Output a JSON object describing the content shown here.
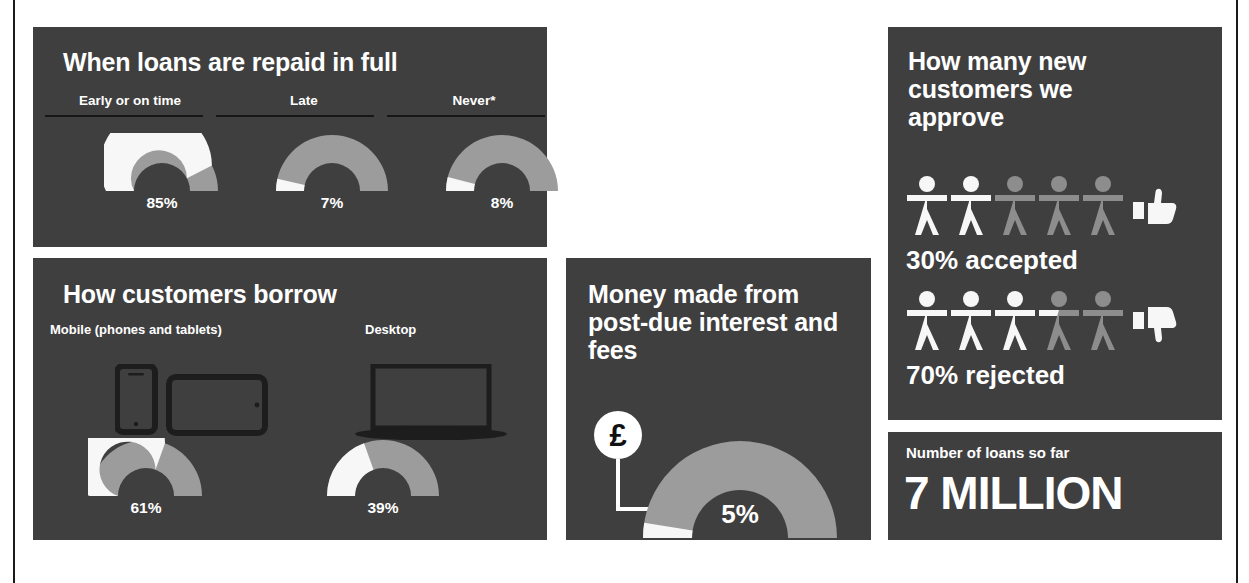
{
  "colors": {
    "background": "#ffffff",
    "panel": "#3f3f3f",
    "value_fill": "#f7f7f7",
    "remainder_fill": "#9c9c9c",
    "text": "#ffffff",
    "rule": "#161616",
    "icon_dark": "#1d1d1d"
  },
  "panels": {
    "repaid": {
      "title": "When loans are repaid in full",
      "columns": [
        {
          "label": "Early or on time",
          "value_text": "85%"
        },
        {
          "label": "Late",
          "value_text": "7%"
        },
        {
          "label": "Never*",
          "value_text": "8%"
        }
      ]
    },
    "borrow": {
      "title": "How customers borrow",
      "columns": [
        {
          "label": "Mobile (phones and tablets)",
          "value_text": "61%",
          "icon": "phone-tablet-icon"
        },
        {
          "label": "Desktop",
          "value_text": "39%",
          "icon": "laptop-icon"
        }
      ]
    },
    "money": {
      "title": "Money made from post-due interest and fees",
      "badge_symbol": "£",
      "badge_icon": "pound-coin-icon",
      "value_text": "5%"
    },
    "approve": {
      "title": "How many new customers we approve",
      "rows": [
        {
          "caption": "30% accepted",
          "icon": "thumbs-up-icon",
          "people_total": 5,
          "people_filled": 2
        },
        {
          "caption": "70% rejected",
          "icon": "thumbs-down-icon",
          "people_total": 5,
          "people_filled": 3
        }
      ]
    },
    "loans": {
      "label": "Number of loans so far",
      "value": "7 MILLION"
    }
  },
  "chart_data": [
    {
      "type": "pie",
      "title": "When loans are repaid in full",
      "categories": [
        "Early or on time",
        "Late",
        "Never*"
      ],
      "values": [
        85,
        7,
        8
      ],
      "unit": "%",
      "note": "Three half-doughnut gauges; each shows its own share of 100%",
      "legend": "none",
      "grid": false
    },
    {
      "type": "pie",
      "title": "How customers borrow",
      "categories": [
        "Mobile (phones and tablets)",
        "Desktop"
      ],
      "values": [
        61,
        39
      ],
      "unit": "%",
      "note": "Two half-doughnut gauges summing to 100%",
      "legend": "none",
      "grid": false
    },
    {
      "type": "pie",
      "title": "Money made from post-due interest and fees",
      "categories": [
        "Post-due interest and fees",
        "Other"
      ],
      "values": [
        5,
        95
      ],
      "unit": "%",
      "note": "Single half-doughnut gauge",
      "legend": "none",
      "grid": false
    },
    {
      "type": "bar",
      "title": "How many new customers we approve",
      "categories": [
        "30% accepted",
        "70% rejected"
      ],
      "values": [
        30,
        70
      ],
      "unit": "%",
      "note": "Pictogram of 5 person icons per row",
      "legend": "none",
      "grid": false
    }
  ]
}
